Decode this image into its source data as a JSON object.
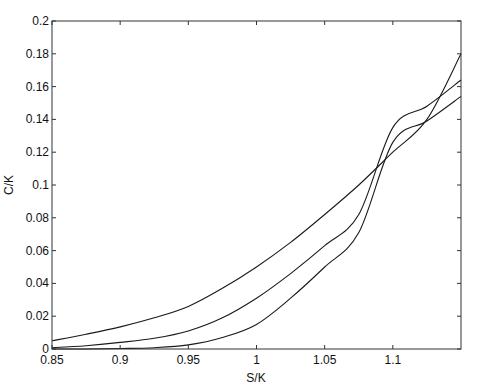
{
  "chart_data": {
    "type": "line",
    "title": "",
    "xlabel": "S/K",
    "ylabel": "C/K",
    "xlim": [
      0.85,
      1.15
    ],
    "ylim": [
      0,
      0.2
    ],
    "grid": false,
    "legend": null,
    "x_ticks": [
      0.85,
      0.9,
      0.95,
      1,
      1.05,
      1.1
    ],
    "x_tick_labels": [
      "0.85",
      "0.9",
      "0.95",
      "1",
      "1.05",
      "1.1"
    ],
    "y_ticks": [
      0,
      0.02,
      0.04,
      0.06,
      0.08,
      0.1,
      0.12,
      0.14,
      0.16,
      0.18,
      0.2
    ],
    "y_tick_labels": [
      "0",
      "0.02",
      "0.04",
      "0.06",
      "0.08",
      "0.1",
      "0.12",
      "0.14",
      "0.16",
      "0.18",
      "0.2"
    ],
    "x": [
      0.85,
      0.875,
      0.9,
      0.925,
      0.95,
      0.975,
      1.0,
      1.025,
      1.05,
      1.075,
      1.1,
      1.125,
      1.15
    ],
    "series": [
      {
        "name": "curve-upper",
        "values": [
          0.005,
          0.009,
          0.0135,
          0.019,
          0.026,
          0.037,
          0.05,
          0.065,
          0.082,
          0.1,
          0.12,
          0.14,
          0.18
        ]
      },
      {
        "name": "curve-middle",
        "values": [
          0.0008,
          0.002,
          0.004,
          0.0065,
          0.011,
          0.019,
          0.031,
          0.046,
          0.063,
          0.082,
          0.135,
          0.148,
          0.164
        ]
      },
      {
        "name": "curve-lower",
        "values": [
          0.0,
          0.0,
          0.0003,
          0.0008,
          0.0025,
          0.007,
          0.015,
          0.031,
          0.05,
          0.071,
          0.126,
          0.139,
          0.154
        ]
      }
    ]
  },
  "plot_area": {
    "left": 52,
    "top": 21,
    "right": 461,
    "bottom": 349
  }
}
